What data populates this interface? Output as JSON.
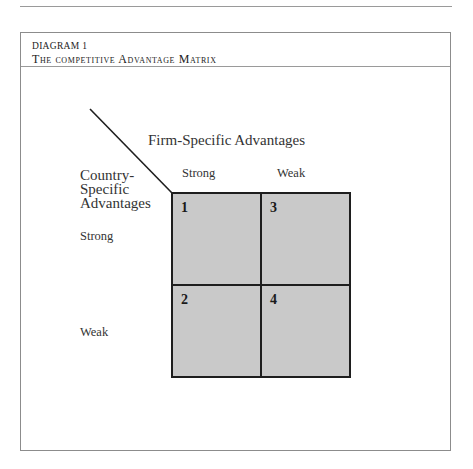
{
  "page": {
    "running_header": "DIAGRAM & MATRIX"
  },
  "figure": {
    "label": "DIAGRAM 1",
    "title": "The competitive Advantage Matrix"
  },
  "matrix": {
    "column_axis_title": "Firm-Specific Advantages",
    "row_axis_title_lines": [
      "Country-",
      "Specific",
      "Advantages"
    ],
    "column_labels": [
      "Strong",
      "Weak"
    ],
    "row_labels": [
      "Strong",
      "Weak"
    ],
    "cells": [
      {
        "number": "1",
        "row": "Strong",
        "column": "Strong"
      },
      {
        "number": "3",
        "row": "Strong",
        "column": "Weak"
      },
      {
        "number": "2",
        "row": "Weak",
        "column": "Strong"
      },
      {
        "number": "4",
        "row": "Weak",
        "column": "Weak"
      }
    ],
    "cell_fill": "#c9c9c9",
    "grid_color": "#1e1e1e"
  }
}
